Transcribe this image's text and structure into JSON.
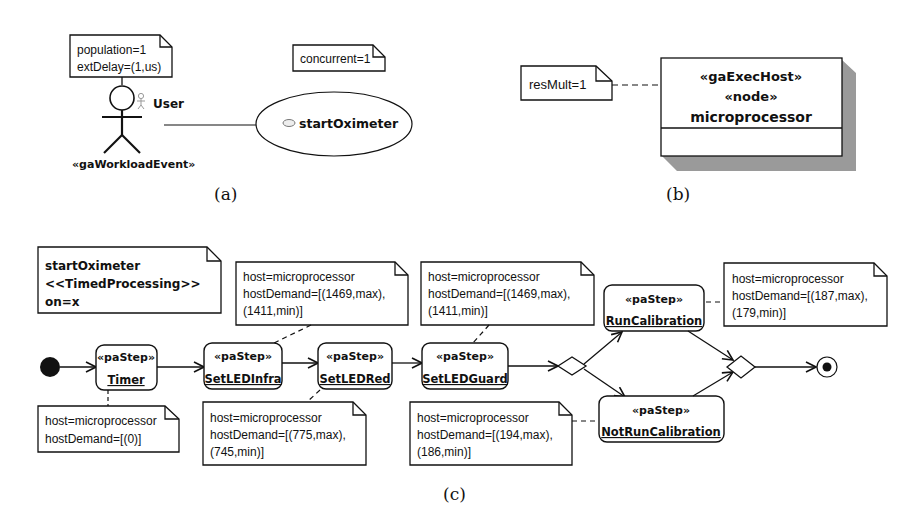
{
  "panel_a": {
    "caption": "(a)",
    "actor_note": {
      "lines": [
        "population=1",
        "extDelay=(1,us)"
      ]
    },
    "usecase_note": {
      "lines": [
        "concurrent=1"
      ]
    },
    "actor": {
      "name": "User",
      "stereotype": "«gaWorkloadEvent»",
      "icon": "actor-icon"
    },
    "use_case": {
      "name": "startOximeter",
      "icon": "use-case-icon"
    }
  },
  "panel_b": {
    "caption": "(b)",
    "note": {
      "lines": [
        "resMult=1"
      ]
    },
    "node": {
      "stereotype1": "«gaExecHost»",
      "stereotype2": "«node»",
      "name": "microprocessor"
    }
  },
  "panel_c": {
    "caption": "(c)",
    "context_note": {
      "lines": [
        "startOximeter",
        "<<TimedProcessing>>",
        "on=x"
      ]
    },
    "steps": [
      {
        "stereotype": "«paStep»",
        "name": "Timer"
      },
      {
        "stereotype": "«paStep»",
        "name": "SetLEDInfra"
      },
      {
        "stereotype": "«paStep»",
        "name": "SetLEDRed"
      },
      {
        "stereotype": "«paStep»",
        "name": "SetLEDGuard"
      },
      {
        "stereotype": "«paStep»",
        "name": "RunCalibration"
      },
      {
        "stereotype": "«paStep»",
        "name": "NotRunCalibration"
      }
    ],
    "notes": {
      "timer": [
        "host=microprocessor",
        "hostDemand=[(0)]"
      ],
      "setledinfra": [
        "host=microprocessor",
        "hostDemand=[(1469,max),",
        "(1411,min)]"
      ],
      "setledred": [
        "host=microprocessor",
        "hostDemand=[(775,max),",
        "(745,min)]"
      ],
      "setledguard": [
        "host=microprocessor",
        "hostDemand=[(1469,max),",
        "(1411,min)]"
      ],
      "runcalibration": [
        "host=microprocessor",
        "hostDemand=[(187,max),",
        "(179,min)]"
      ],
      "notruncalibration": [
        "host=microprocessor",
        "hostDemand=[(194,max),",
        "(186,min)]"
      ]
    }
  }
}
